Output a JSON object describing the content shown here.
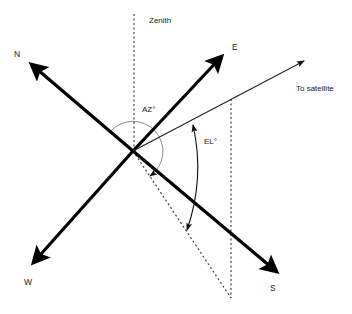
{
  "diagram": {
    "labels": {
      "zenith": "Zenith",
      "north": "N",
      "east": "E",
      "south": "S",
      "west": "W",
      "azimuth": "AZ°",
      "elevation": "EL°",
      "satellite": "To satellite"
    },
    "colors": {
      "axis": "#000000",
      "line": "#222222",
      "arc_az": "#888888",
      "dotted": "#444444"
    }
  }
}
